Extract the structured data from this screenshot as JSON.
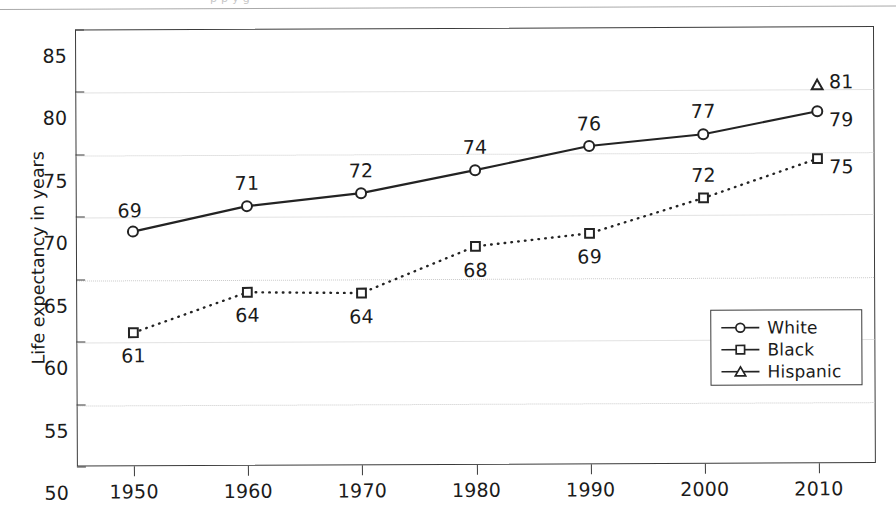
{
  "figure": {
    "cropped_header_ghost": "p          p       y            g       ",
    "yaxis_title": "Life expectancy in years"
  },
  "legend": {
    "position": "lower-right-inside",
    "items": [
      {
        "label": "White",
        "marker": "circle-icon"
      },
      {
        "label": "Black",
        "marker": "square-icon"
      },
      {
        "label": "Hispanic",
        "marker": "triangle-icon"
      }
    ]
  },
  "colors": {
    "line": "#232323",
    "axis": "#3b3b3b",
    "grid": "#c9c9c9",
    "text": "#1b1b1b",
    "background": "#ffffff"
  },
  "chart_data": {
    "type": "line",
    "title": "",
    "xlabel": "",
    "ylabel": "Life expectancy in years",
    "x": [
      1950,
      1960,
      1970,
      1980,
      1990,
      2000,
      2010
    ],
    "xtick_labels": [
      "1950",
      "1960",
      "1970",
      "1980",
      "1990",
      "2000",
      "2010"
    ],
    "ytick_labels": [
      "50",
      "55",
      "60",
      "65",
      "70",
      "75",
      "80",
      "85"
    ],
    "yticks": [
      50,
      55,
      60,
      65,
      70,
      75,
      80,
      85
    ],
    "ylim": [
      50,
      85
    ],
    "xlim": [
      1945,
      2015
    ],
    "grid": true,
    "series": [
      {
        "name": "White",
        "marker": "circle",
        "linestyle": "solid",
        "values": [
          68.8,
          70.8,
          71.8,
          73.6,
          75.5,
          76.4,
          78.2
        ],
        "labels": [
          "69",
          "71",
          "72",
          "74",
          "76",
          "77",
          "79"
        ],
        "label_positions": [
          "above-left",
          "above",
          "above",
          "above",
          "above",
          "above",
          "right"
        ]
      },
      {
        "name": "Black",
        "marker": "square",
        "linestyle": "dotted",
        "values": [
          60.7,
          63.9,
          63.8,
          67.5,
          68.5,
          71.3,
          74.4
        ],
        "labels": [
          "61",
          "64",
          "64",
          "68",
          "69",
          "72",
          "75"
        ],
        "label_positions": [
          "below",
          "below",
          "below",
          "below",
          "below",
          "above",
          "right"
        ]
      },
      {
        "name": "Hispanic",
        "marker": "triangle",
        "linestyle": "none",
        "values": [
          null,
          null,
          null,
          null,
          null,
          null,
          80.3
        ],
        "labels": [
          null,
          null,
          null,
          null,
          null,
          null,
          "81"
        ],
        "label_positions": [
          null,
          null,
          null,
          null,
          null,
          null,
          "right"
        ]
      }
    ]
  }
}
